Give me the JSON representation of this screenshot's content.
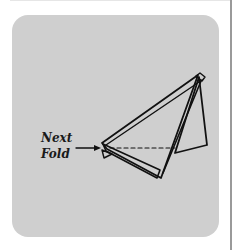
{
  "figure": {
    "type": "folding-instruction",
    "panel_color": "#cfcfcf",
    "line_color": "#111111",
    "annotation": {
      "line1": "Next",
      "line2": "Fold",
      "arrow": "right-arrow"
    },
    "fold_line_style": "dashed"
  }
}
